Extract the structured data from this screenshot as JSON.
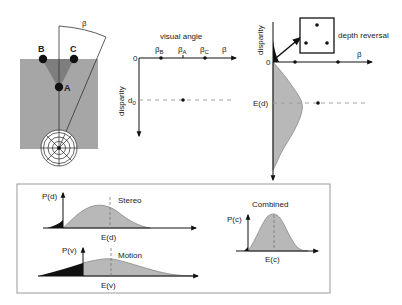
{
  "panel_scene": {
    "angle_label": "β",
    "points": [
      {
        "label": "B"
      },
      {
        "label": "C"
      },
      {
        "label": "A"
      }
    ]
  },
  "panel_disparity_map": {
    "x_axis_title": "visual angle",
    "origin_label": "0",
    "y_axis_label": "disparity",
    "x_ticks": [
      {
        "base": "β",
        "sub": "B"
      },
      {
        "base": "β",
        "sub": "A"
      },
      {
        "base": "β",
        "sub": "C"
      }
    ],
    "x_axis_end_label": "β",
    "d0_label": "d",
    "d0_sub": "0"
  },
  "panel_estimate": {
    "y_axis_label": "disparity",
    "origin_label": "0",
    "x_axis_end_label": "β",
    "expected_label": "E(d)",
    "inset_label": "depth reversal"
  },
  "panel_distributions": {
    "stereo": {
      "y_label": "P(d)",
      "title": "Stereo",
      "x_label": "E(d)"
    },
    "motion": {
      "y_label": "P(v)",
      "title": "Motion",
      "x_label": "E(v)"
    },
    "combined": {
      "y_label": "P(c)",
      "title": "Combined",
      "x_label": "E(c)"
    }
  },
  "colors": {
    "gray_fill": "#a6a6a6",
    "dark_triangle": "#7a7a7a",
    "curve_fill": "#b8b8b8",
    "curve_stroke": "#888888",
    "dashed": "#9a9a9a",
    "box_border": "#999999"
  }
}
